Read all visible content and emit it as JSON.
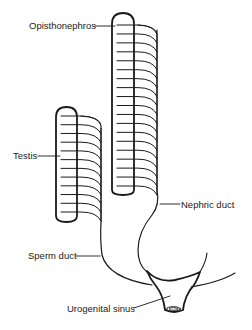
{
  "diagram": {
    "type": "anatomical schematic",
    "labels": {
      "opisthonephros": "Opisthonephros",
      "testis": "Testis",
      "nephric_duct": "Nephric duct",
      "sperm_duct": "Sperm duct",
      "urogenital_sinus": "Urogenital sinus"
    },
    "structures": {
      "opisthonephros": {
        "tubule_count": 19
      },
      "testis": {
        "tubule_count": 12
      }
    },
    "colors": {
      "line": "#1a1a1a",
      "text": "#222222",
      "background": "#ffffff"
    }
  }
}
